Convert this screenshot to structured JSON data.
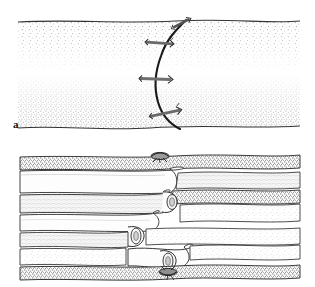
{
  "figure": {
    "kind": "scientific-line-drawing",
    "style": "pen-and-ink stipple illustration",
    "background_color": "#ffffff",
    "ink_color": "#1a1a1a",
    "stipple_color": "#8e8e8e",
    "width": 315,
    "height": 287,
    "panels": [
      {
        "id": "a",
        "label": "a",
        "label_x": 13,
        "label_y": 118,
        "view": "transverse-section",
        "description": "Two stippled tissue masses separated by a pale horizontal gap, traversed by a dark curved thread bearing three transverse cross-anchor elements.",
        "top_boundary_y": 22,
        "bottom_boundary_y": 127,
        "gap_band": {
          "top_y": 62,
          "bottom_y": 78
        },
        "thread": {
          "color": "#1a1a1a",
          "width": 2.1,
          "path": "M 186,20 C 176,30 166,40 161,56 C 155,72 154,88 158,102 C 162,116 170,124 180,129"
        },
        "anchors": [
          {
            "index": 1,
            "x": 182,
            "y": 23,
            "angle": -28,
            "length": 17
          },
          {
            "index": 2,
            "x": 160,
            "y": 43,
            "angle": 4,
            "length": 27
          },
          {
            "index": 3,
            "x": 156,
            "y": 79,
            "angle": 2,
            "length": 30
          },
          {
            "index": 4,
            "x": 166,
            "y": 113,
            "angle": -12,
            "length": 30
          }
        ]
      },
      {
        "id": "b",
        "label": "b",
        "label_x": 13,
        "label_y": 260,
        "view": "longitudinal-section",
        "description": "Stack of tapered tubular fibre layers meeting and interlocking at the midline; dark stippled bands alternate with pale bands; small knots at top and bottom midline.",
        "layer_count": 8,
        "knots": [
          {
            "position": "top",
            "x": 160,
            "y": 156
          },
          {
            "position": "bottom",
            "x": 168,
            "y": 268
          }
        ],
        "interlock_center_x": 165
      }
    ]
  }
}
